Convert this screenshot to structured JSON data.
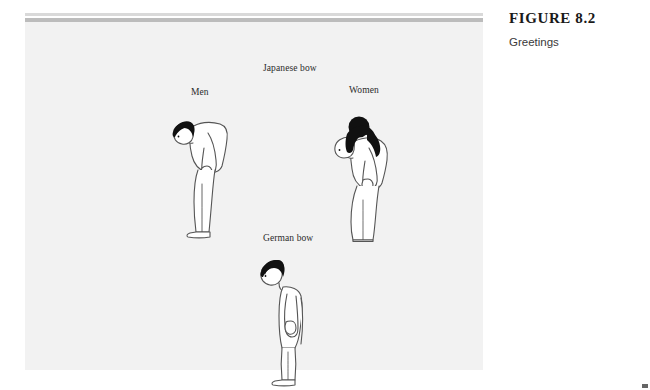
{
  "caption": {
    "figure_number": "FIGURE 8.2",
    "figure_title": "Greetings"
  },
  "figure": {
    "labels": {
      "japanese_bow": "Japanese bow",
      "men": "Men",
      "women": "Women",
      "german_bow": "German bow"
    },
    "background_color": "#f2f2f2",
    "rule_colors": {
      "top": "#d9d9d9",
      "middle": "#bcbcbc"
    },
    "illustrations": [
      {
        "name": "man-bowing",
        "group": "Japanese bow",
        "posture": "deep bow from waist, profile facing left, arms hanging at sides",
        "hair_color": "#111111",
        "outline_color": "#4a4a4a",
        "fill_color": "#ffffff"
      },
      {
        "name": "woman-bowing",
        "group": "Japanese bow",
        "posture": "bow from waist, profile facing left, hair in bun, long skirt",
        "hair_color": "#111111",
        "outline_color": "#4a4a4a",
        "fill_color": "#ffffff"
      },
      {
        "name": "man-german-bow",
        "group": "German bow",
        "posture": "upright stance with slight head nod, profile facing left",
        "hair_color": "#111111",
        "outline_color": "#4a4a4a",
        "fill_color": "#ffffff"
      }
    ]
  }
}
